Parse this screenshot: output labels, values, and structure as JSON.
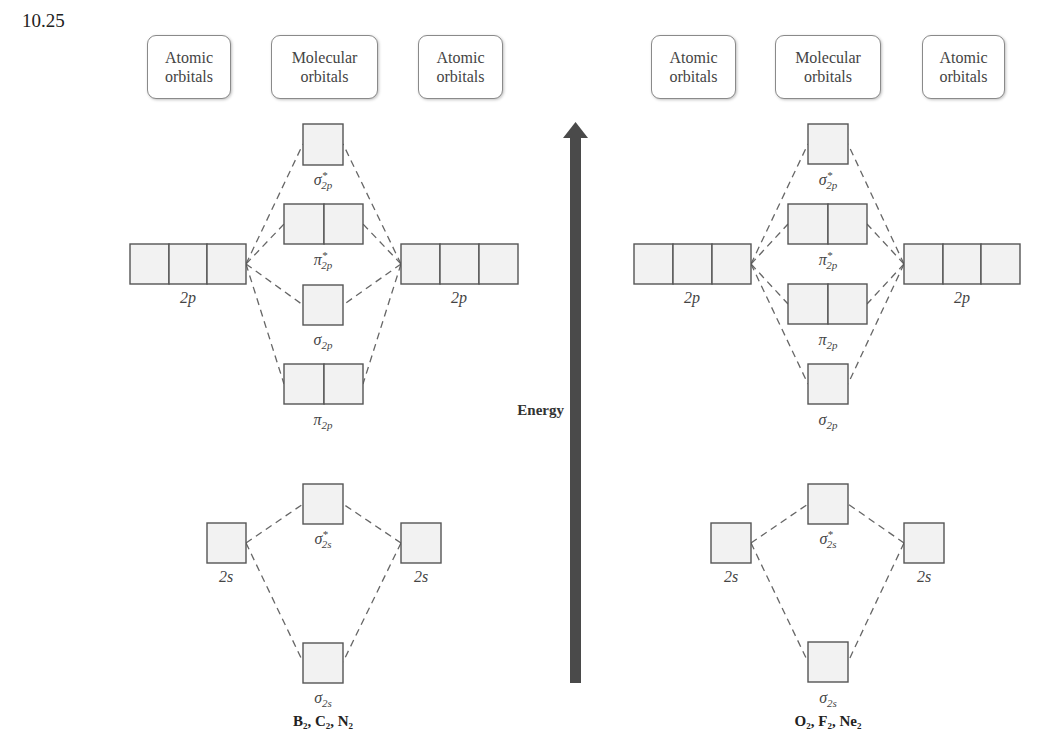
{
  "problem_number": "10.25",
  "energy_axis": {
    "label": "Energy",
    "color": "#4a4a4a"
  },
  "headers": {
    "left": [
      {
        "line1": "Atomic",
        "line2": "orbitals"
      },
      {
        "line1": "Molecular",
        "line2": "orbitals"
      },
      {
        "line1": "Atomic",
        "line2": "orbitals"
      }
    ],
    "right": [
      {
        "line1": "Atomic",
        "line2": "orbitals"
      },
      {
        "line1": "Molecular",
        "line2": "orbitals"
      },
      {
        "line1": "Atomic",
        "line2": "orbitals"
      }
    ]
  },
  "diagrams": [
    {
      "molecules": "B₂, C₂, N₂",
      "atomic_2p_label": "2p",
      "atomic_2s_label": "2s",
      "mo_order_top_to_bottom": [
        "σ*2p",
        "π*2p",
        "σ2p",
        "π2p",
        "σ*2s",
        "σ2s"
      ],
      "labels": {
        "sigma_star_2p": "σ*2p",
        "pi_star_2p": "π*2p",
        "sigma_2p": "σ2p",
        "pi_2p": "π2p",
        "sigma_star_2s": "σ*2s",
        "sigma_2s": "σ2s"
      }
    },
    {
      "molecules": "O₂, F₂, Ne₂",
      "atomic_2p_label": "2p",
      "atomic_2s_label": "2s",
      "mo_order_top_to_bottom": [
        "σ*2p",
        "π*2p",
        "π2p",
        "σ2p",
        "σ*2s",
        "σ2s"
      ],
      "labels": {
        "sigma_star_2p": "σ*2p",
        "pi_star_2p": "π*2p",
        "pi_2p": "π2p",
        "sigma_2p": "σ2p",
        "sigma_star_2s": "σ*2s",
        "sigma_2s": "σ2s"
      }
    }
  ]
}
